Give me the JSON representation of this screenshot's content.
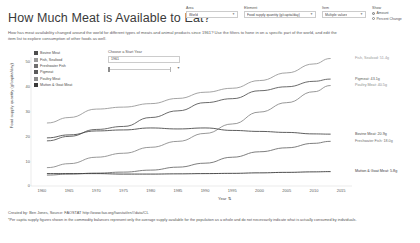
{
  "header": {
    "title": "How Much Meat is Available to Eat?",
    "subtitle": "How has meat availability changed around the world for different types of meats and animal products since 1961? Use the filters to hone in on a specific part of the world, and edit the item list to explore consumption of other foods as well."
  },
  "filters": {
    "area": {
      "label": "Area",
      "value": "World"
    },
    "element": {
      "label": "Element",
      "value": "Food supply quantity (g/capita/day)"
    },
    "item": {
      "label": "Item",
      "value": "Multiple values"
    },
    "show": {
      "label": "Show",
      "options": [
        {
          "label": "Amount",
          "selected": true
        },
        {
          "label": "Percent Change",
          "selected": false
        }
      ]
    }
  },
  "start_year": {
    "label": "Choose a Start Year",
    "value": "1961"
  },
  "legend": {
    "items": [
      {
        "label": "Bovine Meat",
        "color": "#4d4d4d"
      },
      {
        "label": "Fish, Seafood",
        "color": "#9a9a9a"
      },
      {
        "label": "Freshwater Fish",
        "color": "#6f6f6f"
      },
      {
        "label": "Pigmeat",
        "color": "#5a5a5a"
      },
      {
        "label": "Poultry Meat",
        "color": "#8c8c8c"
      },
      {
        "label": "Mutton & Goat Meat",
        "color": "#3a3a3a"
      }
    ]
  },
  "footer": {
    "credit": "Created by: Ben Jones, Source: FAOSTAT http://www.fao.org/faostat/en/#data/CL",
    "note": "*Per capita supply figures shown in the commodity balances represent only the average supply available for the population as a whole and do not necessarily indicate what is actually consumed by individuals."
  },
  "chart_data": {
    "type": "line",
    "title": "How Much Meat is Available to Eat?",
    "xlabel": "Year",
    "ylabel": "Food supply quantity (g/capita/day)",
    "xlim": [
      1958,
      2017
    ],
    "ylim": [
      0,
      52
    ],
    "yticks": [
      0,
      10,
      20,
      30,
      40,
      50
    ],
    "xticks": [
      1960,
      1965,
      1970,
      1975,
      1980,
      1985,
      1990,
      1995,
      2000,
      2005,
      2010,
      2015
    ],
    "grid": false,
    "legend_position": "top-left",
    "x": [
      1961,
      1965,
      1970,
      1975,
      1980,
      1985,
      1990,
      1995,
      2000,
      2005,
      2010,
      2013
    ],
    "series": [
      {
        "name": "Fish, Seafood",
        "color": "#9a9a9a",
        "end_label": "Fish, Seafood: 51.4g",
        "values": [
          25.4,
          27.6,
          31.0,
          31.8,
          33.2,
          35.3,
          37.8,
          39.4,
          42.5,
          45.6,
          49.2,
          51.4
        ]
      },
      {
        "name": "Pigmeat",
        "color": "#5a5a5a",
        "end_label": "Pigmeat: 43.1g",
        "values": [
          18.2,
          20.0,
          22.8,
          24.0,
          27.6,
          30.3,
          33.6,
          35.2,
          38.4,
          40.0,
          42.2,
          43.1
        ]
      },
      {
        "name": "Poultry Meat",
        "color": "#8c8c8c",
        "end_label": "Poultry Meat: 40.5g",
        "values": [
          7.4,
          9.0,
          11.6,
          13.2,
          15.6,
          18.0,
          21.2,
          25.0,
          29.8,
          33.6,
          38.0,
          40.5
        ]
      },
      {
        "name": "Bovine Meat",
        "color": "#4d4d4d",
        "end_label": "Bovine Meat: 20.9g",
        "values": [
          19.4,
          20.6,
          22.2,
          22.6,
          23.4,
          23.0,
          23.4,
          22.4,
          22.0,
          21.6,
          21.0,
          20.9
        ]
      },
      {
        "name": "Freshwater Fish",
        "color": "#6f6f6f",
        "end_label": "Freshwater Fish: 18.0g",
        "values": [
          4.4,
          4.8,
          5.2,
          5.6,
          6.4,
          7.6,
          9.2,
          11.6,
          13.8,
          15.4,
          17.2,
          18.0
        ]
      },
      {
        "name": "Mutton & Goat Meat",
        "color": "#3a3a3a",
        "end_label": "Mutton & Goat Meat: 5.8g",
        "values": [
          5.0,
          5.0,
          5.0,
          4.8,
          4.8,
          4.9,
          5.0,
          5.1,
          5.3,
          5.5,
          5.7,
          5.8
        ]
      }
    ]
  }
}
